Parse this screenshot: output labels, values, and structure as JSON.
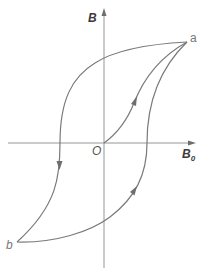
{
  "diagram": {
    "title": "",
    "type": "magnetic hysteresis loop",
    "axes": {
      "y_label": "B",
      "x_label": "B",
      "x_label_subscript": "0",
      "origin_label": "O"
    },
    "points": [
      {
        "id": "a",
        "label": "a",
        "description": "positive saturation point"
      },
      {
        "id": "b",
        "label": "b",
        "description": "negative saturation point"
      }
    ],
    "curves": [
      {
        "id": "initial-magnetization",
        "from": "O",
        "to": "a",
        "arrow": "toward a"
      },
      {
        "id": "descending-branch",
        "from": "a",
        "to": "b",
        "arrow": "downward, left of y-axis"
      },
      {
        "id": "ascending-branch",
        "from": "b",
        "to": "a",
        "arrow": "upward, right of y-axis"
      }
    ],
    "colors": {
      "axis": "#8a8a8a",
      "curve": "#7a7a7a",
      "label": "#555555"
    }
  }
}
